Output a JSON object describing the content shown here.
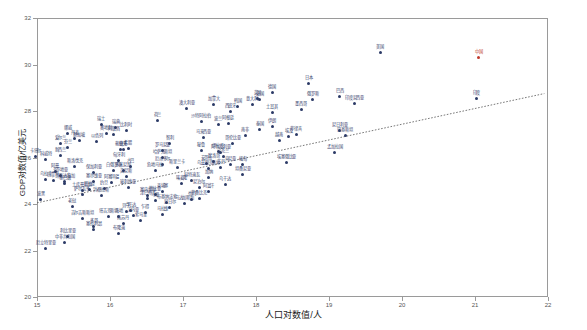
{
  "chart_data": {
    "type": "scatter",
    "title": "",
    "xlabel": "人口对数值/人",
    "ylabel": "GDP对数值/亿美元",
    "xlim": [
      15,
      22
    ],
    "ylim": [
      20,
      32
    ],
    "xticks": [
      15,
      16,
      17,
      18,
      19,
      20,
      21,
      22
    ],
    "yticks": [
      20,
      22,
      24,
      26,
      28,
      30,
      32
    ],
    "grid": false,
    "legend": null,
    "trendline": {
      "visible": true,
      "style": "dotted",
      "x_start": 15.0,
      "y_start": 24.05,
      "x_end": 21.95,
      "y_end": 28.75
    },
    "highlight_color": "#c0392b",
    "point_color": "#2b3a66",
    "points": [
      {
        "label": "美国",
        "x": 19.7,
        "y": 30.52,
        "hl": false
      },
      {
        "label": "中国",
        "x": 21.05,
        "y": 30.3,
        "hl": true
      },
      {
        "label": "印度",
        "x": 21.02,
        "y": 28.55,
        "hl": false
      },
      {
        "label": "日本",
        "x": 18.72,
        "y": 29.18,
        "hl": false
      },
      {
        "label": "德国",
        "x": 18.22,
        "y": 28.8,
        "hl": false
      },
      {
        "label": "英国",
        "x": 18.02,
        "y": 28.55,
        "hl": false
      },
      {
        "label": "法国",
        "x": 18.05,
        "y": 28.48,
        "hl": false
      },
      {
        "label": "巴西",
        "x": 19.15,
        "y": 28.62,
        "hl": false
      },
      {
        "label": "意大利",
        "x": 17.95,
        "y": 28.3,
        "hl": false
      },
      {
        "label": "加拿大",
        "x": 17.42,
        "y": 28.28,
        "hl": false
      },
      {
        "label": "韩国",
        "x": 17.75,
        "y": 28.2,
        "hl": false
      },
      {
        "label": "俄罗斯",
        "x": 18.78,
        "y": 28.48,
        "hl": false
      },
      {
        "label": "西班牙",
        "x": 17.65,
        "y": 28.0,
        "hl": false
      },
      {
        "label": "澳大利亚",
        "x": 17.05,
        "y": 28.1,
        "hl": false
      },
      {
        "label": "墨西哥",
        "x": 18.62,
        "y": 28.05,
        "hl": false
      },
      {
        "label": "印度尼西亚",
        "x": 19.35,
        "y": 28.32,
        "hl": false
      },
      {
        "label": "荷兰",
        "x": 16.65,
        "y": 27.6,
        "hl": false
      },
      {
        "label": "土耳其",
        "x": 18.22,
        "y": 27.95,
        "hl": false
      },
      {
        "label": "沙特阿拉伯",
        "x": 17.25,
        "y": 27.55,
        "hl": false
      },
      {
        "label": "瑞士",
        "x": 15.88,
        "y": 27.4,
        "hl": false
      },
      {
        "label": "瑞典",
        "x": 16.08,
        "y": 27.3,
        "hl": false
      },
      {
        "label": "波兰",
        "x": 17.48,
        "y": 27.4,
        "hl": false
      },
      {
        "label": "比利时",
        "x": 16.22,
        "y": 27.18,
        "hl": false
      },
      {
        "label": "阿根廷",
        "x": 17.62,
        "y": 27.45,
        "hl": false
      },
      {
        "label": "挪威",
        "x": 15.42,
        "y": 27.05,
        "hl": false
      },
      {
        "label": "奥地利",
        "x": 15.95,
        "y": 27.05,
        "hl": false
      },
      {
        "label": "伊朗",
        "x": 18.22,
        "y": 27.35,
        "hl": false
      },
      {
        "label": "泰国",
        "x": 18.05,
        "y": 27.2,
        "hl": false
      },
      {
        "label": "阿联酋",
        "x": 16.05,
        "y": 27.0,
        "hl": false
      },
      {
        "label": "尼日利亚",
        "x": 19.15,
        "y": 27.15,
        "hl": false
      },
      {
        "label": "以色列",
        "x": 15.82,
        "y": 26.7,
        "hl": false
      },
      {
        "label": "南非",
        "x": 17.85,
        "y": 26.95,
        "hl": false
      },
      {
        "label": "丹麦",
        "x": 15.52,
        "y": 26.8,
        "hl": false
      },
      {
        "label": "新加坡",
        "x": 15.58,
        "y": 26.72,
        "hl": false
      },
      {
        "label": "马来西亚",
        "x": 17.28,
        "y": 26.85,
        "hl": false
      },
      {
        "label": "菲律宾",
        "x": 18.55,
        "y": 27.0,
        "hl": false
      },
      {
        "label": "埃及",
        "x": 18.45,
        "y": 26.9,
        "hl": false
      },
      {
        "label": "爱尔兰",
        "x": 15.32,
        "y": 26.6,
        "hl": false
      },
      {
        "label": "芬兰",
        "x": 15.42,
        "y": 26.45,
        "hl": false
      },
      {
        "label": "智利",
        "x": 16.82,
        "y": 26.6,
        "hl": false
      },
      {
        "label": "巴基斯坦",
        "x": 19.22,
        "y": 26.95,
        "hl": false
      },
      {
        "label": "希腊",
        "x": 16.25,
        "y": 26.4,
        "hl": false
      },
      {
        "label": "葡萄牙",
        "x": 16.15,
        "y": 26.35,
        "hl": false
      },
      {
        "label": "哥伦比亚",
        "x": 17.68,
        "y": 26.6,
        "hl": false
      },
      {
        "label": "捷克",
        "x": 16.18,
        "y": 26.35,
        "hl": false
      },
      {
        "label": "罗马尼亚",
        "x": 16.72,
        "y": 26.3,
        "hl": false
      },
      {
        "label": "越南",
        "x": 18.32,
        "y": 26.72,
        "hl": false
      },
      {
        "label": "新西兰",
        "x": 15.32,
        "y": 26.1,
        "hl": false
      },
      {
        "label": "秘鲁",
        "x": 17.25,
        "y": 26.3,
        "hl": false
      },
      {
        "label": "伊拉克",
        "x": 17.48,
        "y": 26.25,
        "hl": false
      },
      {
        "label": "卡塔尔",
        "x": 14.98,
        "y": 26.05,
        "hl": false
      },
      {
        "label": "阿尔及利亚",
        "x": 17.52,
        "y": 26.2,
        "hl": false
      },
      {
        "label": "哈萨克斯坦",
        "x": 16.72,
        "y": 26.02,
        "hl": false
      },
      {
        "label": "科威特",
        "x": 15.12,
        "y": 25.9,
        "hl": false
      },
      {
        "label": "匈牙利",
        "x": 16.12,
        "y": 25.88,
        "hl": false
      },
      {
        "label": "乌克兰",
        "x": 17.55,
        "y": 26.05,
        "hl": false
      },
      {
        "label": "摩洛哥",
        "x": 17.42,
        "y": 25.82,
        "hl": false
      },
      {
        "label": "安哥拉",
        "x": 17.32,
        "y": 25.75,
        "hl": false
      },
      {
        "label": "孟加拉国",
        "x": 19.08,
        "y": 26.2,
        "hl": false
      },
      {
        "label": "厄瓜多尔",
        "x": 16.72,
        "y": 25.7,
        "hl": false
      },
      {
        "label": "斯洛伐克",
        "x": 15.52,
        "y": 25.62,
        "hl": false
      },
      {
        "label": "古巴",
        "x": 16.28,
        "y": 25.6,
        "hl": false
      },
      {
        "label": "苏丹",
        "x": 17.52,
        "y": 25.58,
        "hl": false
      },
      {
        "label": "斯里兰卡",
        "x": 16.92,
        "y": 25.55,
        "hl": false
      },
      {
        "label": "肯尼亚",
        "x": 17.65,
        "y": 25.72,
        "hl": false
      },
      {
        "label": "多米尼加",
        "x": 16.18,
        "y": 25.45,
        "hl": false
      },
      {
        "label": "埃塞俄比亚",
        "x": 18.42,
        "y": 25.8,
        "hl": false
      },
      {
        "label": "危地马拉",
        "x": 16.62,
        "y": 25.42,
        "hl": false
      },
      {
        "label": "阿曼",
        "x": 15.25,
        "y": 25.38,
        "hl": false
      },
      {
        "label": "缅甸",
        "x": 17.82,
        "y": 25.7,
        "hl": false
      },
      {
        "label": "乌兹别克斯坦",
        "x": 17.35,
        "y": 25.52,
        "hl": false
      },
      {
        "label": "保加利亚",
        "x": 15.78,
        "y": 25.35,
        "hl": false
      },
      {
        "label": "白俄罗斯",
        "x": 16.05,
        "y": 25.42,
        "hl": false
      },
      {
        "label": "克罗地亚",
        "x": 15.32,
        "y": 25.22,
        "hl": false
      },
      {
        "label": "突尼斯",
        "x": 16.22,
        "y": 25.18,
        "hl": false
      },
      {
        "label": "立陶宛",
        "x": 14.92,
        "y": 25.1,
        "hl": false
      },
      {
        "label": "乌拉圭",
        "x": 15.12,
        "y": 25.05,
        "hl": false
      },
      {
        "label": "巴拿马",
        "x": 15.22,
        "y": 25.0,
        "hl": false
      },
      {
        "label": "哥斯达黎加",
        "x": 15.38,
        "y": 24.98,
        "hl": false
      },
      {
        "label": "塞尔维亚",
        "x": 15.78,
        "y": 24.95,
        "hl": false
      },
      {
        "label": "黎巴嫩",
        "x": 15.38,
        "y": 24.9,
        "hl": false
      },
      {
        "label": "阿塞拜疆",
        "x": 16.02,
        "y": 24.92,
        "hl": false
      },
      {
        "label": "坦桑尼亚",
        "x": 17.82,
        "y": 25.28,
        "hl": false
      },
      {
        "label": "加纳",
        "x": 17.35,
        "y": 25.15,
        "hl": false
      },
      {
        "label": "科特迪瓦",
        "x": 17.12,
        "y": 25.02,
        "hl": false
      },
      {
        "label": "喀麦隆",
        "x": 16.98,
        "y": 24.88,
        "hl": false
      },
      {
        "label": "玻利维亚",
        "x": 16.25,
        "y": 24.72,
        "hl": false
      },
      {
        "label": "巴拉圭",
        "x": 15.72,
        "y": 24.62,
        "hl": false
      },
      {
        "label": "约旦",
        "x": 15.92,
        "y": 24.68,
        "hl": false
      },
      {
        "label": "土库曼斯坦",
        "x": 15.62,
        "y": 24.58,
        "hl": false
      },
      {
        "label": "斯洛文尼亚",
        "x": 14.82,
        "y": 24.55,
        "hl": false
      },
      {
        "label": "拉脱维亚",
        "x": 14.58,
        "y": 24.45,
        "hl": false
      },
      {
        "label": "乌干达",
        "x": 17.58,
        "y": 24.85,
        "hl": false
      },
      {
        "label": "尼泊尔",
        "x": 17.22,
        "y": 24.7,
        "hl": false
      },
      {
        "label": "柬埔寨",
        "x": 16.72,
        "y": 24.55,
        "hl": false
      },
      {
        "label": "萨尔瓦多",
        "x": 15.62,
        "y": 24.4,
        "hl": false
      },
      {
        "label": "洪都拉斯",
        "x": 15.88,
        "y": 24.35,
        "hl": false
      },
      {
        "label": "赞比亚",
        "x": 16.62,
        "y": 24.42,
        "hl": false
      },
      {
        "label": "塞内加尔",
        "x": 16.52,
        "y": 24.35,
        "hl": false
      },
      {
        "label": "津巴布韦",
        "x": 16.52,
        "y": 24.22,
        "hl": false
      },
      {
        "label": "阿富汗",
        "x": 17.35,
        "y": 24.55,
        "hl": false
      },
      {
        "label": "马里",
        "x": 16.62,
        "y": 24.15,
        "hl": false
      },
      {
        "label": "布基纳法索",
        "x": 16.78,
        "y": 24.08,
        "hl": false
      },
      {
        "label": "莫桑比克",
        "x": 17.22,
        "y": 24.25,
        "hl": false
      },
      {
        "label": "马达加斯加",
        "x": 17.02,
        "y": 24.02,
        "hl": false
      },
      {
        "label": "也门",
        "x": 17.12,
        "y": 24.18,
        "hl": false
      },
      {
        "label": "爱沙尼亚",
        "x": 14.12,
        "y": 24.15,
        "hl": false
      },
      {
        "label": "波黑",
        "x": 15.05,
        "y": 24.18,
        "hl": false
      },
      {
        "label": "阿尔巴尼亚",
        "x": 14.92,
        "y": 23.95,
        "hl": false
      },
      {
        "label": "蒙古",
        "x": 14.82,
        "y": 23.72,
        "hl": false
      },
      {
        "label": "老挝",
        "x": 15.48,
        "y": 23.9,
        "hl": false
      },
      {
        "label": "尼日尔",
        "x": 16.82,
        "y": 23.85,
        "hl": false
      },
      {
        "label": "卢旺达",
        "x": 16.28,
        "y": 23.72,
        "hl": false
      },
      {
        "label": "贝宁",
        "x": 16.22,
        "y": 23.68,
        "hl": false
      },
      {
        "label": "乍得",
        "x": 16.48,
        "y": 23.62,
        "hl": false
      },
      {
        "label": "马拉维",
        "x": 16.72,
        "y": 23.55,
        "hl": false
      },
      {
        "label": "几内亚",
        "x": 16.32,
        "y": 23.52,
        "hl": false
      },
      {
        "label": "海地",
        "x": 16.12,
        "y": 23.48,
        "hl": false
      },
      {
        "label": "塔吉克斯坦",
        "x": 15.98,
        "y": 23.45,
        "hl": false
      },
      {
        "label": "吉尔吉斯斯坦",
        "x": 15.62,
        "y": 23.38,
        "hl": false
      },
      {
        "label": "索马里",
        "x": 16.42,
        "y": 23.28,
        "hl": false
      },
      {
        "label": "南苏丹",
        "x": 16.18,
        "y": 23.18,
        "hl": false
      },
      {
        "label": "北马其顿",
        "x": 14.52,
        "y": 23.25,
        "hl": false
      },
      {
        "label": "博茨瓦纳",
        "x": 14.72,
        "y": 23.35,
        "hl": false
      },
      {
        "label": "纳米比亚",
        "x": 14.68,
        "y": 23.3,
        "hl": false
      },
      {
        "label": "毛里求斯",
        "x": 14.12,
        "y": 23.42,
        "hl": false
      },
      {
        "label": "黑山",
        "x": 13.42,
        "y": 22.85,
        "hl": false
      },
      {
        "label": "塞拉利昂",
        "x": 15.78,
        "y": 22.92,
        "hl": false
      },
      {
        "label": "布隆迪",
        "x": 16.12,
        "y": 22.75,
        "hl": false
      },
      {
        "label": "多哥",
        "x": 15.78,
        "y": 23.02,
        "hl": false
      },
      {
        "label": "冈比亚",
        "x": 14.78,
        "y": 22.55,
        "hl": false
      },
      {
        "label": "莱索托",
        "x": 14.62,
        "y": 22.62,
        "hl": false
      },
      {
        "label": "不丹",
        "x": 13.52,
        "y": 22.5,
        "hl": false
      },
      {
        "label": "利比里亚",
        "x": 15.42,
        "y": 22.6,
        "hl": false
      },
      {
        "label": "吉布提",
        "x": 13.82,
        "y": 22.4,
        "hl": false
      },
      {
        "label": "中非共和国",
        "x": 15.38,
        "y": 22.35,
        "hl": false
      },
      {
        "label": "厄立特里亚",
        "x": 15.12,
        "y": 22.1,
        "hl": false
      },
      {
        "label": "几内亚比绍",
        "x": 14.42,
        "y": 22.18,
        "hl": false
      },
      {
        "label": "佛得角",
        "x": 13.08,
        "y": 22.05,
        "hl": false
      },
      {
        "label": "科摩罗",
        "x": 13.55,
        "y": 21.95,
        "hl": false
      },
      {
        "label": "苏里南",
        "x": 13.22,
        "y": 22.3,
        "hl": false
      },
      {
        "label": "伯利兹",
        "x": 12.82,
        "y": 21.85,
        "hl": false
      },
      {
        "label": "圭亚那",
        "x": 13.45,
        "y": 22.2,
        "hl": false
      }
    ]
  }
}
